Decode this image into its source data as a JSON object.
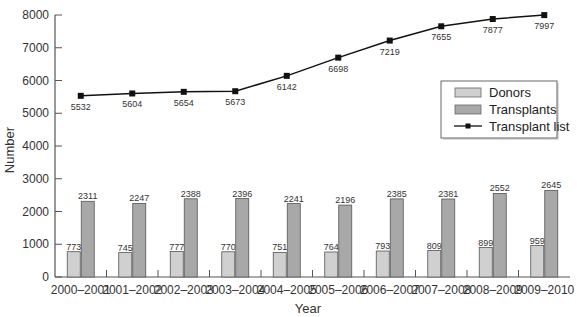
{
  "chart_data": {
    "type": "bar+line",
    "title": "",
    "xlabel": "Year",
    "ylabel": "Number",
    "ylim": [
      0,
      8000
    ],
    "yticks": [
      0,
      1000,
      2000,
      3000,
      4000,
      5000,
      6000,
      7000,
      8000
    ],
    "grid": false,
    "legend_position": "right, upper-middle",
    "categories": [
      "2000–2001",
      "2001–2002",
      "2002–2003",
      "2003–2004",
      "2004–2005",
      "2005–2006",
      "2006–2007",
      "2007–2008",
      "2008–2009",
      "2009–2010"
    ],
    "series": [
      {
        "name": "Donors",
        "type": "bar",
        "color": "#d0d0d0",
        "values": [
          773,
          745,
          777,
          770,
          751,
          764,
          793,
          809,
          899,
          959
        ]
      },
      {
        "name": "Transplants",
        "type": "bar",
        "color": "#a8a8a8",
        "values": [
          2311,
          2247,
          2388,
          2396,
          2241,
          2196,
          2385,
          2381,
          2552,
          2645
        ]
      },
      {
        "name": "Transplant list",
        "type": "line",
        "color": "#111111",
        "marker": "square",
        "values": [
          5532,
          5604,
          5654,
          5673,
          6142,
          6698,
          7219,
          7655,
          7877,
          7997
        ]
      }
    ]
  },
  "legend": {
    "items": [
      "Donors",
      "Transplants",
      "Transplant list"
    ]
  }
}
